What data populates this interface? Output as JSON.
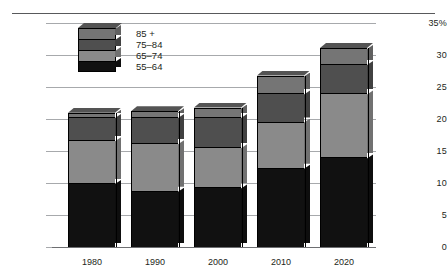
{
  "chart_data": {
    "type": "bar",
    "subtype": "stacked-bar-3d",
    "title": "",
    "xlabel": "",
    "ylabel": "",
    "ylim": [
      0,
      35
    ],
    "yticks": [
      "0",
      "5",
      "10",
      "15",
      "20",
      "25",
      "30",
      "35%"
    ],
    "ytick_values": [
      0,
      5,
      10,
      15,
      20,
      25,
      30,
      35
    ],
    "grid": true,
    "legend_position": "upper-left-inside",
    "categories": [
      "1980",
      "1990",
      "2000",
      "2010",
      "2020"
    ],
    "series": [
      {
        "name": "55–64",
        "values": [
          10.0,
          8.8,
          9.3,
          12.4,
          14.0
        ],
        "color": "#111111"
      },
      {
        "name": "65–74",
        "values": [
          6.7,
          7.4,
          6.3,
          7.2,
          10.0
        ],
        "color": "#8a8a8a"
      },
      {
        "name": "75–84",
        "values": [
          3.6,
          4.1,
          4.7,
          4.4,
          4.6
        ],
        "color": "#4f4f4f"
      },
      {
        "name": "85 +",
        "values": [
          0.7,
          0.9,
          1.5,
          2.8,
          2.5
        ],
        "color": "#757575"
      }
    ],
    "totals": [
      21.0,
      21.2,
      21.8,
      26.8,
      31.1
    ]
  },
  "legend": {
    "items": [
      {
        "label": "85 +"
      },
      {
        "label": "75–84"
      },
      {
        "label": "65–74"
      },
      {
        "label": "55–64"
      }
    ]
  },
  "colors": {
    "age_55_64": "#111111",
    "age_65_74": "#8a8a8a",
    "age_75_84": "#4f4f4f",
    "age_85_plus": "#757575",
    "gridline": "#a7a9ac",
    "axis": "#6d6e71",
    "text": "#231f20",
    "background": "#ffffff"
  }
}
